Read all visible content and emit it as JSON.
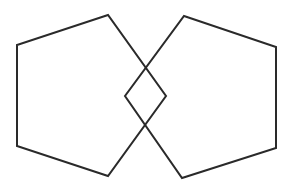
{
  "diagram": {
    "width": 297,
    "height": 189,
    "background": "#ffffff",
    "stroke_color": "#2a2a2a",
    "stroke_width": 2,
    "shapes": [
      {
        "name": "left-pentagon",
        "points": [
          [
            108,
            15
          ],
          [
            17,
            45
          ],
          [
            17,
            146
          ],
          [
            108,
            176
          ],
          [
            166,
            96
          ]
        ]
      },
      {
        "name": "right-pentagon",
        "points": [
          [
            184,
            16
          ],
          [
            276,
            47
          ],
          [
            276,
            148
          ],
          [
            182,
            178
          ],
          [
            125,
            96
          ]
        ]
      }
    ],
    "intersection": {
      "shape": "rhombus",
      "points": [
        [
          145,
          67
        ],
        [
          166,
          96
        ],
        [
          145,
          124
        ],
        [
          125,
          96
        ]
      ]
    }
  }
}
